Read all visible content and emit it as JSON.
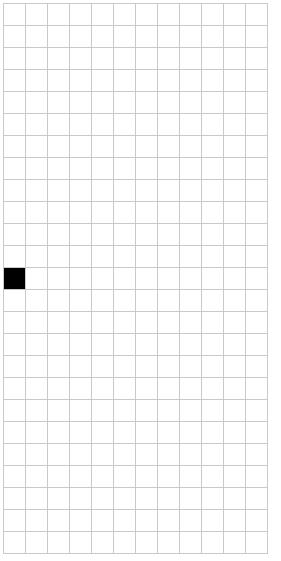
{
  "app": {
    "title": "Grid Canvas",
    "background_color": "#ffffff"
  },
  "board": {
    "name": "pixel-grid",
    "columns": 12,
    "rows": 25,
    "cell_size_px": 22,
    "origin_x_px": 3,
    "origin_y_px": 3,
    "grid_line_color": "#c9c9c9",
    "grid_line_width_px": 1,
    "empty_cell_color": "#ffffff",
    "filled_cell_color": "#000000",
    "filled_cells": [
      {
        "row": 13,
        "column": 1
      }
    ],
    "filled_cell_count": 1,
    "total_cell_count": 300
  }
}
